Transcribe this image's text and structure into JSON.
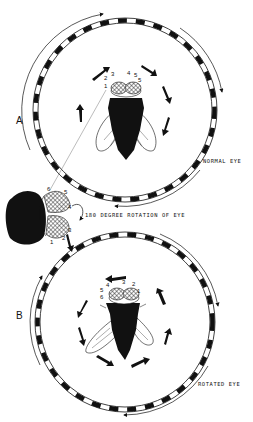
{
  "figure": {
    "panels": [
      {
        "id": "A",
        "letter": "A",
        "caption": "NORMAL EYE",
        "eye_numbers": [
          "1",
          "2",
          "3",
          "4",
          "5",
          "6"
        ],
        "drum_rotation": "clockwise",
        "fly_turn_direction": "clockwise"
      },
      {
        "id": "B",
        "letter": "B",
        "caption": "ROTATED EYE",
        "eye_numbers": [
          "6",
          "5",
          "4",
          "3",
          "2",
          "1"
        ],
        "drum_rotation": "clockwise",
        "fly_turn_direction": "counterclockwise"
      }
    ],
    "inset": {
      "caption": "180 DEGREE  ROTATION OF EYE",
      "eye_numbers": [
        "1",
        "2",
        "3",
        "4",
        "5",
        "6"
      ]
    },
    "colors": {
      "ink": "#111111",
      "background": "#ffffff"
    }
  }
}
